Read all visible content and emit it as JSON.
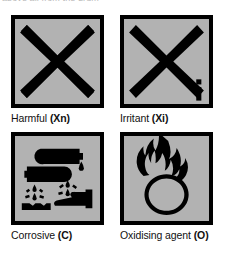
{
  "page": {
    "cut_off_header_text": "above all from the drum",
    "background_color": "#ffffff",
    "symbol_fill_color": "#b2b2b2",
    "symbol_ink_color": "#000000"
  },
  "symbols": [
    {
      "icon": "saint-andrews-cross-icon",
      "pictogram": "black saltire cross",
      "name": "Harmful",
      "code": "Xn",
      "caption_prefix": "Harmful",
      "caption_code": "(Xn)",
      "corner_mark": ""
    },
    {
      "icon": "saint-andrews-cross-with-i-icon",
      "pictogram": "black saltire cross with lowercase i",
      "name": "Irritant",
      "code": "Xi",
      "caption_prefix": "Irritant",
      "caption_code": "(Xi)",
      "corner_mark": "i"
    },
    {
      "icon": "corrosive-icon",
      "pictogram": "two test tubes pouring liquid onto a surface and a hand",
      "name": "Corrosive",
      "code": "C",
      "caption_prefix": "Corrosive",
      "caption_code": "(C)",
      "corner_mark": ""
    },
    {
      "icon": "oxidising-agent-icon",
      "pictogram": "flame burning over a circle",
      "name": "Oxidising agent",
      "code": "O",
      "caption_prefix": "Oxidising agent",
      "caption_code": "(O)",
      "corner_mark": ""
    }
  ]
}
